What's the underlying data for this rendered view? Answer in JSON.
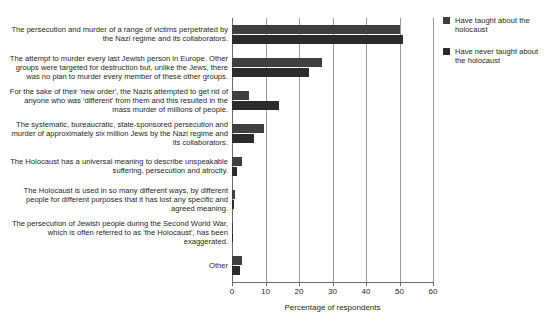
{
  "chart_data": {
    "type": "bar",
    "orientation": "horizontal",
    "title": "",
    "subtitle": "",
    "xlabel": "Percentage of respondents",
    "ylabel": "",
    "xlim": [
      0,
      60
    ],
    "xticks": [
      0,
      10,
      20,
      30,
      40,
      50,
      60
    ],
    "xtick_labels": [
      "0",
      "10",
      "20",
      "30",
      "40",
      "50",
      "60"
    ],
    "grid": true,
    "grid_axis": "x",
    "legend_position": "top-right",
    "categories": [
      "The persecution and murder of a range of victims perpetrated by the Nazi regime and its collaborators.",
      "The attempt to murder every last Jewish person in Europe. Other groups were targeted for destruction but, unlike the Jews, there was no plan to murder every member of these other groups.",
      "For the sake of their 'new order', the Nazis attempted to get rid of anyone who was 'different' from them and this resulted in the mass murder of millions of people.",
      "The systematic, bureaucratic, state-sponsored persecution and murder of approximately six million Jews by the Nazi regime and its collaborators.",
      "The Holocaust has a universal meaning to describe unspeakable suffering, persecution and atrocity.",
      "The Holocaust is used in so many different ways, by different people for different purposes that it has lost any specific and agreed meaning.",
      "The persecution of Jewish people during the Second World War, which is often referred to as 'the Holocaust', has been exaggerated.",
      "Other"
    ],
    "series": [
      {
        "name": "Have taught about the holocaust",
        "color": "#3f3f3f",
        "values": [
          50,
          27,
          5,
          9.5,
          3,
          1,
          0.3,
          3
        ]
      },
      {
        "name": "Have never taught about the holocaust",
        "color": "#2b2b2b",
        "values": [
          51,
          23,
          14,
          6.5,
          1.5,
          0.6,
          0.2,
          2.5
        ]
      }
    ]
  },
  "legend": {
    "items": [
      {
        "label": "Have taught about the holocaust"
      },
      {
        "label": "Have never taught about the holocaust"
      }
    ]
  },
  "colors": {
    "series_0": "#3f3f3f",
    "series_1": "#2b2b2b",
    "grid": "#9a9a9a",
    "axis": "#6b6b6b",
    "text": "#231f20",
    "background": "#ffffff"
  }
}
